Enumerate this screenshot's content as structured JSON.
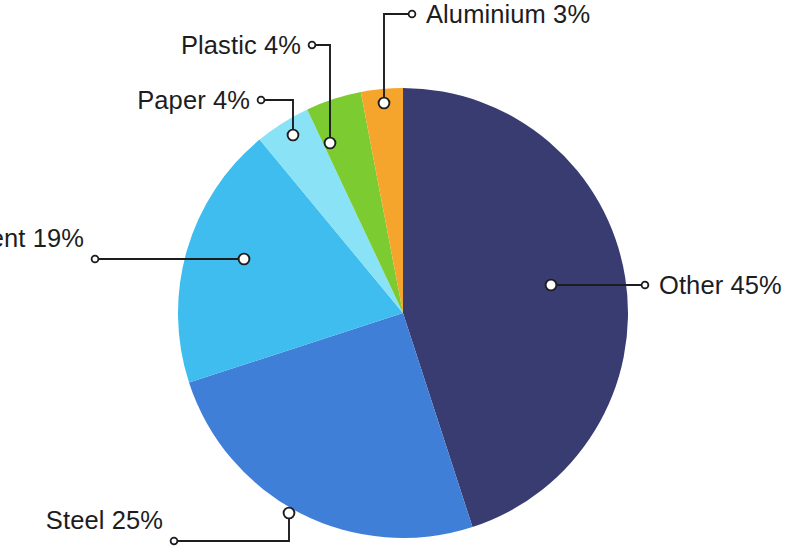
{
  "chart_data": {
    "type": "pie",
    "title": "",
    "subtitle": "",
    "xlabel": "",
    "ylabel": "",
    "legend_position": "callout-labels",
    "grid": false,
    "units": "percent",
    "total": 100,
    "categories": [
      "Other",
      "Steel",
      "Cement",
      "Paper",
      "Plastic",
      "Aluminium"
    ],
    "values": [
      45,
      25,
      19,
      4,
      4,
      3
    ],
    "colors": [
      "#393c70",
      "#3f7fd8",
      "#3ebdee",
      "#8ae2f7",
      "#7ccb31",
      "#f5a52c"
    ],
    "slices": [
      {
        "name": "Other",
        "value": 45,
        "label": "Other 45%",
        "color": "#393c70",
        "start_angle_deg": 0,
        "end_angle_deg": 162
      },
      {
        "name": "Steel",
        "value": 25,
        "label": "Steel 25%",
        "color": "#3f7fd8",
        "start_angle_deg": 162,
        "end_angle_deg": 252
      },
      {
        "name": "Cement",
        "value": 19,
        "label": "Cement 19%",
        "color": "#3ebdee",
        "start_angle_deg": 252,
        "end_angle_deg": 320.4
      },
      {
        "name": "Paper",
        "value": 4,
        "label": "Paper 4%",
        "color": "#8ae2f7",
        "start_angle_deg": 320.4,
        "end_angle_deg": 334.8
      },
      {
        "name": "Plastic",
        "value": 4,
        "label": "Plastic 4%",
        "color": "#7ccb31",
        "start_angle_deg": 334.8,
        "end_angle_deg": 349.2
      },
      {
        "name": "Aluminium",
        "value": 3,
        "label": "Aluminium 3%",
        "color": "#f5a52c",
        "start_angle_deg": 349.2,
        "end_angle_deg": 360
      }
    ]
  },
  "labels": {
    "aluminium": "Aluminium 3%",
    "plastic": "Plastic 4%",
    "paper": "Paper 4%",
    "cement": "Cement 19%",
    "other": "Other 45%",
    "steel": "Steel 25%"
  },
  "colors": {
    "background": "#ffffff",
    "text": "#1d1d1f",
    "leader": "#1d1d20",
    "other": "#393c70",
    "steel": "#3f7fd8",
    "cement": "#3ebdee",
    "paper": "#8ae2f7",
    "plastic": "#7ccb31",
    "aluminium": "#f5a52c"
  }
}
